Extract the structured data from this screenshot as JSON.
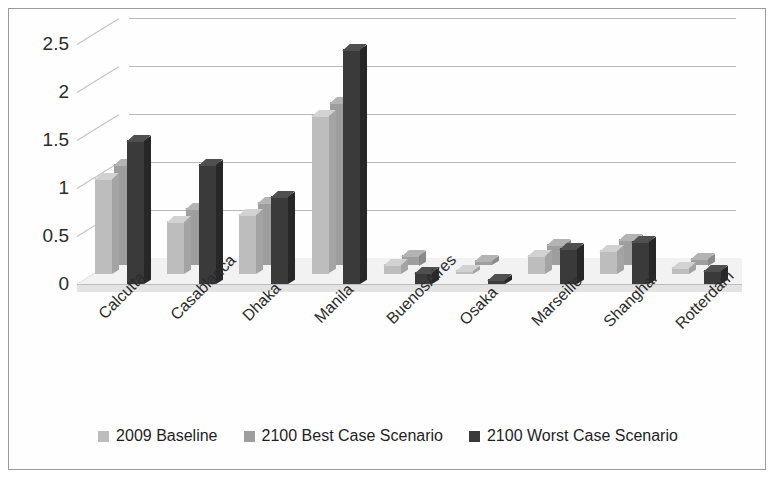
{
  "chart_data": {
    "type": "bar",
    "title": "",
    "subtitle": "",
    "xlabel": "",
    "ylabel": "",
    "ylim": [
      0,
      2.5
    ],
    "yticks": [
      "0",
      "0.5",
      "1",
      "1.5",
      "2",
      "2.5"
    ],
    "grid": true,
    "legend_position": "bottom",
    "style": "3d-grouped-bar",
    "categories": [
      "Calcutta",
      "Casablanca",
      "Dhaka",
      "Manila",
      "BuenosAires",
      "Osaka",
      "Marseille",
      "Shanghai",
      "Rotterdam"
    ],
    "series": [
      {
        "name": "2009 Baseline",
        "color": "#bdbdbd",
        "values": [
          1.0,
          0.55,
          0.62,
          1.65,
          0.1,
          0.04,
          0.2,
          0.25,
          0.07
        ]
      },
      {
        "name": "2100 Best Case Scenario",
        "color": "#9e9e9e",
        "values": [
          1.05,
          0.6,
          0.66,
          1.7,
          0.11,
          0.05,
          0.22,
          0.27,
          0.08
        ]
      },
      {
        "name": "2100 Worst Case Scenario",
        "color": "#3a3a3a",
        "values": [
          1.5,
          1.25,
          0.92,
          2.45,
          0.12,
          0.05,
          0.38,
          0.45,
          0.15
        ]
      }
    ]
  },
  "legend": {
    "items": [
      {
        "label": "2009 Baseline",
        "swatch": "#bdbdbd"
      },
      {
        "label": "2100 Best Case Scenario",
        "swatch": "#9e9e9e"
      },
      {
        "label": "2100 Worst Case Scenario",
        "swatch": "#3a3a3a"
      }
    ]
  },
  "colors": {
    "background": "#ffffff",
    "border": "#9a9a9a",
    "gridline": "#b9b9b9",
    "text": "#2b2b2b"
  }
}
